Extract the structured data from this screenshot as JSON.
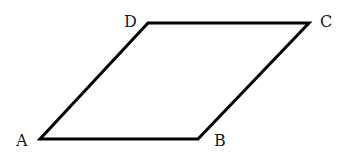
{
  "diagram": {
    "type": "parallelogram",
    "stroke_color": "#000000",
    "label_color": "#1a1a1a",
    "vertices": [
      {
        "name": "A",
        "x": 40,
        "y": 139,
        "label_x": 16,
        "label_y": 146
      },
      {
        "name": "B",
        "x": 198,
        "y": 139,
        "label_x": 214,
        "label_y": 146
      },
      {
        "name": "C",
        "x": 309,
        "y": 23,
        "label_x": 320,
        "label_y": 27
      },
      {
        "name": "D",
        "x": 148,
        "y": 23,
        "label_x": 124,
        "label_y": 27
      }
    ],
    "labels": {
      "A": "A",
      "B": "B",
      "C": "C",
      "D": "D"
    }
  }
}
